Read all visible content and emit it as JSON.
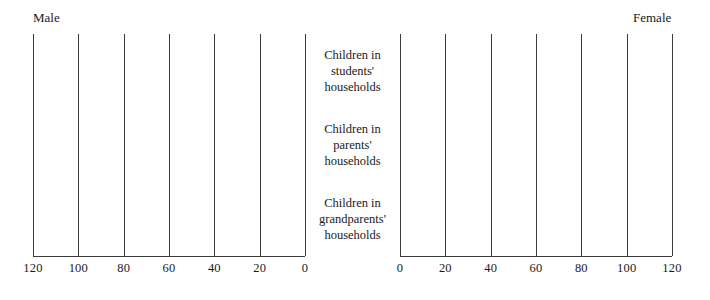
{
  "chart": {
    "left_header": "Male",
    "right_header": "Female"
  },
  "chart_data": {
    "type": "bar",
    "title": "",
    "subtitle": "",
    "orientation": "horizontal",
    "layout": "population-pyramid",
    "xlabel": "",
    "ylabel": "",
    "grid": true,
    "legend": "none",
    "categories": [
      "Children in\nstudents'\nhouseholds",
      "Children in\nparents'\nhouseholds",
      "Children in\ngrandparents'\nhouseholds"
    ],
    "panels": [
      {
        "name": "Male",
        "side": "left",
        "direction": "right-to-left",
        "xlim": [
          0,
          120
        ],
        "ticks": [
          120,
          100,
          80,
          60,
          40,
          20,
          0
        ],
        "tick_labels": [
          "120",
          "100",
          "80",
          "60",
          "40",
          "20",
          "0"
        ],
        "values": [
          null,
          null,
          null
        ]
      },
      {
        "name": "Female",
        "side": "right",
        "direction": "left-to-right",
        "xlim": [
          0,
          120
        ],
        "ticks": [
          0,
          20,
          40,
          60,
          80,
          100,
          120
        ],
        "tick_labels": [
          "0",
          "20",
          "40",
          "60",
          "80",
          "100",
          "120"
        ],
        "values": [
          null,
          null,
          null
        ]
      }
    ],
    "series": [
      {
        "name": "Male",
        "values": [
          null,
          null,
          null
        ]
      },
      {
        "name": "Female",
        "values": [
          null,
          null,
          null
        ]
      }
    ]
  },
  "style": {
    "background": "#ffffff",
    "line_color": "#3c3c3c",
    "text_color": "#1a1a1a"
  }
}
